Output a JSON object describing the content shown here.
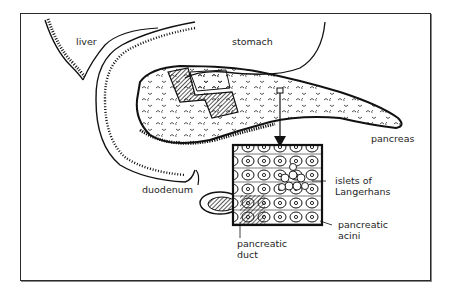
{
  "figure": {
    "type": "anatomical-diagram",
    "labels": {
      "liver": "liver",
      "stomach": "stomach",
      "pancreas": "pancreas",
      "duodenum": "duodenum",
      "islets_line1": "islets of",
      "islets_line2": "Langerhans",
      "acini_line1": "pancreatic",
      "acini_line2": "acini",
      "duct_line1": "pancreatic",
      "duct_line2": "duct"
    },
    "colors": {
      "ink": "#1e1e1e",
      "background": "#ffffff",
      "frame": "#2a2a2a"
    }
  }
}
